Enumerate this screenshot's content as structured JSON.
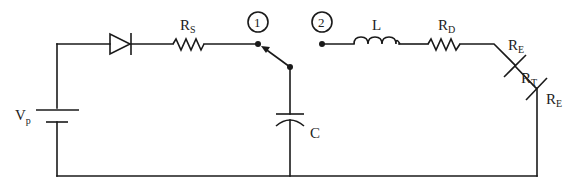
{
  "diagram": {
    "type": "circuit-schematic",
    "components": {
      "source": {
        "symbol": "V",
        "subscript": "p",
        "kind": "battery"
      },
      "diode": {
        "kind": "diode"
      },
      "rs": {
        "symbol": "R",
        "subscript": "S",
        "kind": "resistor"
      },
      "capacitor": {
        "symbol": "C",
        "kind": "capacitor"
      },
      "inductor": {
        "symbol": "L",
        "kind": "inductor"
      },
      "rd": {
        "symbol": "R",
        "subscript": "D",
        "kind": "resistor"
      },
      "re1": {
        "symbol": "R",
        "subscript": "E",
        "kind": "electrode-resistance"
      },
      "rt": {
        "symbol": "R",
        "subscript": "T",
        "kind": "tissue-resistance"
      },
      "re2": {
        "symbol": "R",
        "subscript": "E",
        "kind": "electrode-resistance"
      }
    },
    "switch": {
      "positions": [
        {
          "id": "node-1",
          "label": "1"
        },
        {
          "id": "node-2",
          "label": "2"
        }
      ],
      "current_position": "1"
    },
    "colors": {
      "line": "#1a1a1a",
      "background": "#ffffff"
    }
  }
}
